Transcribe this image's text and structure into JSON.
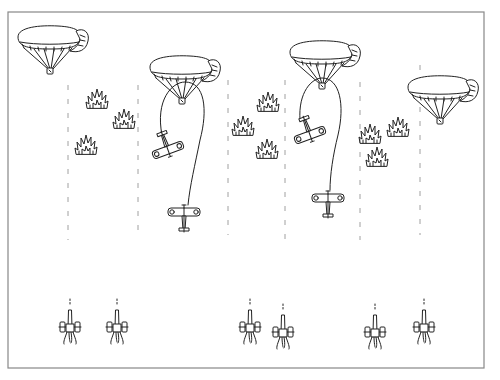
{
  "illustration": {
    "subject": "Observation balloons defended by anti-aircraft guns, with biplanes attacking and flak bursts",
    "style": "black line drawing on white",
    "frame": {
      "x": 8,
      "y": 12,
      "width": 476,
      "height": 356,
      "color": "#888888"
    },
    "ink_color": "#222222",
    "dashed_lines_x": [
      68,
      138,
      228,
      285,
      360,
      420
    ],
    "balloons": [
      {
        "id": "balloon-1",
        "x": 50,
        "y": 45
      },
      {
        "id": "balloon-2",
        "x": 182,
        "y": 75
      },
      {
        "id": "balloon-3",
        "x": 322,
        "y": 60
      },
      {
        "id": "balloon-4",
        "x": 440,
        "y": 95
      }
    ],
    "biplanes": [
      {
        "id": "plane-banking-1",
        "x": 168,
        "y": 145,
        "rotation": -20
      },
      {
        "id": "plane-climbing-1",
        "x": 184,
        "y": 215,
        "rotation": 0
      },
      {
        "id": "plane-banking-2",
        "x": 310,
        "y": 130,
        "rotation": -20
      },
      {
        "id": "plane-climbing-2",
        "x": 328,
        "y": 200,
        "rotation": 0
      }
    ],
    "flak_bursts": [
      {
        "x": 97,
        "y": 100
      },
      {
        "x": 124,
        "y": 120
      },
      {
        "x": 86,
        "y": 146
      },
      {
        "x": 268,
        "y": 103
      },
      {
        "x": 243,
        "y": 127
      },
      {
        "x": 267,
        "y": 150
      },
      {
        "x": 370,
        "y": 135
      },
      {
        "x": 398,
        "y": 128
      },
      {
        "x": 377,
        "y": 158
      }
    ],
    "aa_guns": [
      {
        "x": 70,
        "y": 330
      },
      {
        "x": 117,
        "y": 330
      },
      {
        "x": 250,
        "y": 330
      },
      {
        "x": 283,
        "y": 335
      },
      {
        "x": 375,
        "y": 335
      },
      {
        "x": 424,
        "y": 330
      }
    ]
  }
}
